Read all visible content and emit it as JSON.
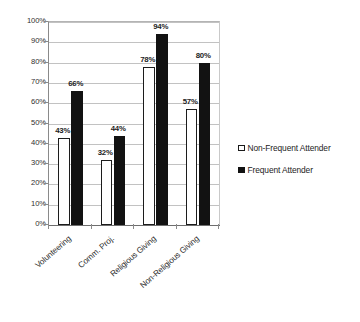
{
  "chart_data": {
    "type": "bar",
    "title": "",
    "subtitle": "",
    "xlabel": "",
    "ylabel": "",
    "categories": [
      "Volunteering",
      "Comm. Proj.",
      "Religious Giving",
      "Non-Religious Giving"
    ],
    "series": [
      {
        "name": "Non-Frequent Attender",
        "values": [
          43,
          32,
          78,
          57
        ],
        "value_labels": [
          "43%",
          "32%",
          "78%",
          "57%"
        ],
        "color": "#ffffff",
        "edge_color": "#1c1c1c"
      },
      {
        "name": "Frequent Attender",
        "values": [
          66,
          44,
          94,
          80
        ],
        "value_labels": [
          "66%",
          "44%",
          "94%",
          "80%"
        ],
        "color": "#121212",
        "edge_color": "#121212"
      }
    ],
    "ylim": [
      0,
      100
    ],
    "ytick_values": [
      0,
      10,
      20,
      30,
      40,
      50,
      60,
      70,
      80,
      90,
      100
    ],
    "ytick_labels": [
      "0%",
      "10%",
      "20%",
      "30%",
      "40%",
      "50%",
      "60%",
      "70%",
      "80%",
      "90%",
      "100%"
    ],
    "grid": true,
    "grid_axis": "y",
    "legend_position": "right",
    "legend": [
      {
        "label": "Non-Frequent Attender",
        "marker": "hollow-square"
      },
      {
        "label": "Frequent Attender",
        "marker": "filled-square"
      }
    ],
    "xtick_label_rotation": -41,
    "background_color": "#ffffff",
    "gridline_color": "#c2c2c2",
    "axis_color": "#8a8a8a"
  }
}
